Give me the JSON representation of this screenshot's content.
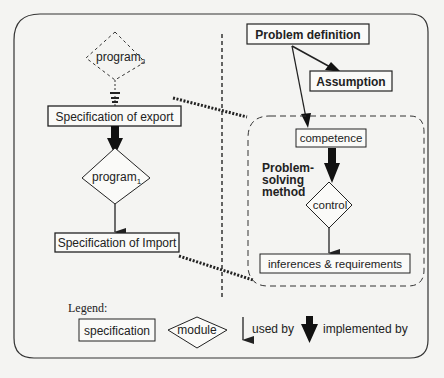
{
  "diagram": {
    "left": {
      "program2": "program",
      "program2_sub": "2",
      "spec_export": "Specification of export",
      "program1": "program",
      "program1_sub": "1",
      "spec_import": "Specification of Import"
    },
    "right": {
      "problem_definition": "Problem definition",
      "assumption": "Assumption",
      "competence": "competence",
      "psm_line1": "Problem-",
      "psm_line2": "solving",
      "psm_line3": "method",
      "control": "control",
      "inferences": "inferences & requirements"
    },
    "legend": {
      "title": "Legend:",
      "specification": "specification",
      "module": "module",
      "used_by": "used by",
      "implemented_by": "implemented by"
    }
  },
  "colors": {
    "ink": "#222222",
    "background": "#f4f4f2"
  }
}
